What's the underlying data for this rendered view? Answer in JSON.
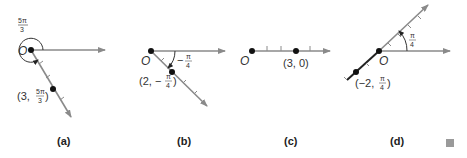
{
  "panels": [
    {
      "caption": "(a)",
      "origin_label": "O",
      "angle_label": "5π/3",
      "angle_num": "5π",
      "angle_den": "3",
      "point_label_prefix": "(3, ",
      "point_label_num": "5π",
      "point_label_den": "3",
      "point_label_suffix": ")"
    },
    {
      "caption": "(b)",
      "origin_label": "O",
      "angle_label": "−π/4",
      "angle_sign": "−",
      "angle_num": "π",
      "angle_den": "4",
      "point_label_prefix": "(2, −",
      "point_label_num": "π",
      "point_label_den": "4",
      "point_label_suffix": ")"
    },
    {
      "caption": "(c)",
      "origin_label": "O",
      "point_label": "(3, 0)"
    },
    {
      "caption": "(d)",
      "origin_label": "O",
      "angle_label": "π/4",
      "angle_num": "π",
      "angle_den": "4",
      "point_label_prefix": "(−2, ",
      "point_label_num": "π",
      "point_label_den": "4",
      "point_label_suffix": ")"
    }
  ],
  "end_marker": "■"
}
